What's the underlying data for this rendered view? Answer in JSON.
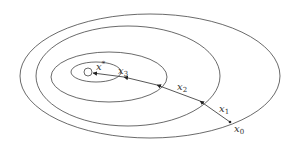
{
  "diagram": {
    "title": "",
    "contours": [
      {
        "cx": 150,
        "cy": 76,
        "rx": 130,
        "ry": 62
      },
      {
        "cx": 128,
        "cy": 76,
        "rx": 92,
        "ry": 50
      },
      {
        "cx": 109,
        "cy": 76,
        "rx": 58,
        "ry": 25
      },
      {
        "cx": 95,
        "cy": 72,
        "rx": 25,
        "ry": 10
      }
    ],
    "minimum": {
      "x": 88,
      "y": 72,
      "r": 4
    },
    "points": [
      {
        "id": "x0",
        "x": 230,
        "y": 122
      },
      {
        "id": "x1",
        "x": 200,
        "y": 101
      },
      {
        "id": "x2",
        "x": 157,
        "y": 85
      },
      {
        "id": "x3",
        "x": 124,
        "y": 77
      },
      {
        "id": "x4",
        "x": 93,
        "y": 73
      }
    ],
    "labels": {
      "xstar_base": "x",
      "xstar_sup": "*",
      "x0_base": "x",
      "x0_sub": "0",
      "x1_base": "x",
      "x1_sub": "1",
      "x2_base": "x",
      "x2_sub": "2",
      "x3_base": "x",
      "x3_sub": "3"
    },
    "colors": {
      "line": "#444444",
      "background": "#ffffff"
    }
  }
}
